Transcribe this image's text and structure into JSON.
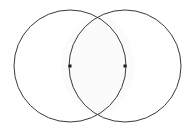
{
  "figure": {
    "name": "vesica-piscis",
    "canvas": {
      "width": 192,
      "height": 128,
      "background_color": "#ffffff"
    },
    "style": {
      "stroke_color": "#3a3a3a",
      "stroke_width": 1,
      "fill_color": "none",
      "lens_fill_color": "#fbfbfb",
      "point_color": "#1a1a1a",
      "point_size": 3
    },
    "circles": [
      {
        "label": "left-circle",
        "cx": 70,
        "cy": 66,
        "r": 56
      },
      {
        "label": "right-circle",
        "cx": 125,
        "cy": 66,
        "r": 56
      }
    ],
    "center_points": [
      {
        "label": "left-center-point",
        "cx": 70,
        "cy": 66
      },
      {
        "label": "right-center-point",
        "cx": 125,
        "cy": 66
      }
    ],
    "intersections": [
      {
        "label": "upper-intersection",
        "cx": 98,
        "cy": 13
      },
      {
        "label": "lower-intersection",
        "cx": 98,
        "cy": 118
      }
    ],
    "lens_path": "M 98 13 A 56 56 0 0 0 98 118 A 56 56 0 0 0 98 13 Z"
  }
}
